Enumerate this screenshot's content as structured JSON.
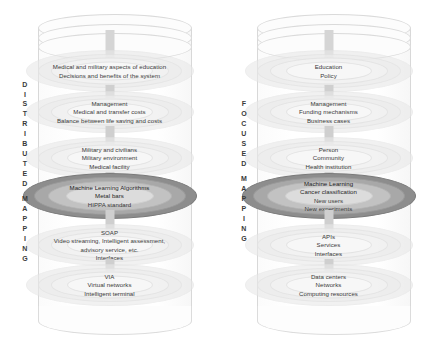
{
  "diagram": {
    "colors": {
      "highlight_outer": "#8d8d8d",
      "highlight_mid": "#a8a8a8",
      "highlight_inner": "#c2c2c2",
      "pale_disc": "#e9e9e9",
      "connector": "#cfcfcf",
      "text": "#3a3a3a"
    }
  },
  "cylinders": [
    {
      "id": "distributed",
      "caption": "DISTRIBUTED MAPPING",
      "caption_words": [
        "DISTRIBUTED",
        "MAPPING"
      ],
      "layers": [
        {
          "id": "education",
          "highlighted": false,
          "lines": [
            "Medical and military aspects of education",
            "Decisions and benefits of the system"
          ]
        },
        {
          "id": "management",
          "highlighted": false,
          "lines": [
            "Management",
            "Medical and transfer costs",
            "Balance between life saving and costs"
          ]
        },
        {
          "id": "people",
          "highlighted": false,
          "lines": [
            "Military and civilians",
            "Military environment",
            "Medical facility"
          ]
        },
        {
          "id": "machine-learning",
          "highlighted": true,
          "lines": [
            "Machine Learning Algorithms",
            "Metal bars",
            "HIPPA standard"
          ]
        },
        {
          "id": "services",
          "highlighted": false,
          "lines": [
            "SOAP",
            "Video streaming, Intelligent assessment,",
            "advisory service, etc.",
            "Interfaces"
          ]
        },
        {
          "id": "infrastructure",
          "highlighted": false,
          "lines": [
            "VIA",
            "Virtual networks",
            "Intelligent terminal"
          ]
        }
      ]
    },
    {
      "id": "focused",
      "caption": "FOCUSED MAPPING",
      "caption_words": [
        "FOCUSED",
        "MAPPING"
      ],
      "layers": [
        {
          "id": "education",
          "highlighted": false,
          "lines": [
            "Education",
            "Policy"
          ]
        },
        {
          "id": "management",
          "highlighted": false,
          "lines": [
            "Management",
            "Funding mechanisms",
            "Business cases"
          ]
        },
        {
          "id": "people",
          "highlighted": false,
          "lines": [
            "Person",
            "Community",
            "Health institution"
          ]
        },
        {
          "id": "machine-learning",
          "highlighted": true,
          "lines": [
            "Machine Learning",
            "Cancer classification",
            "New users",
            "New experiments"
          ]
        },
        {
          "id": "services",
          "highlighted": false,
          "lines": [
            "APIs",
            "Services",
            "Interfaces"
          ]
        },
        {
          "id": "infrastructure",
          "highlighted": false,
          "lines": [
            "Data centers",
            "Networks",
            "Computing resources"
          ]
        }
      ]
    }
  ]
}
